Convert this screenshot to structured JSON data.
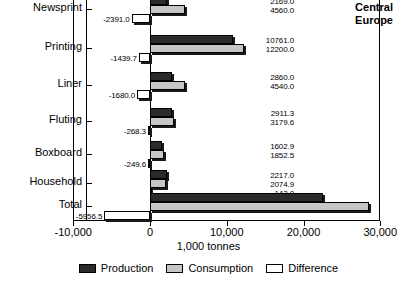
{
  "chart_data": {
    "type": "bar",
    "title": "Central\nEurope",
    "xlabel": "1,000 tonnes",
    "ylabel": "",
    "orientation": "horizontal",
    "grid": false,
    "legend_position": "bottom",
    "xlim": [
      -10000,
      30000
    ],
    "xticks": [
      -10000,
      0,
      10000,
      20000,
      30000
    ],
    "xtick_labels": [
      "-10,000",
      "0",
      "10,000",
      "20,000",
      "30,000"
    ],
    "categories": [
      "Newsprint",
      "Printing",
      "Liner",
      "Fluting",
      "Boxboard",
      "Household",
      "Total"
    ],
    "series": [
      {
        "name": "Production",
        "color": "#2b2b2b",
        "values": [
          2169.0,
          10761.0,
          2860.0,
          2911.3,
          1602.9,
          2217.0,
          22521.0
        ]
      },
      {
        "name": "Consumption",
        "color": "#c6c6c6",
        "values": [
          4560.0,
          12200.0,
          4540.0,
          3179.6,
          1852.5,
          2074.9,
          28477.0
        ]
      },
      {
        "name": "Difference",
        "color": "#ffffff",
        "values": [
          -2391.0,
          -1439.7,
          -1680.0,
          -268.3,
          -249.6,
          143.0,
          -5956.5
        ]
      }
    ],
    "production_labels": [
      "2169.0",
      "10761.0",
      "2860.0",
      "2911.3",
      "1602.9",
      "2217.0",
      "22521.0"
    ],
    "consumption_labels": [
      "4560.0",
      "12200.0",
      "4540.0",
      "3179.6",
      "1852.5",
      "2074.9",
      "28477.0"
    ],
    "difference_labels": [
      "-2391.0",
      "-1439.7",
      "-1680.0",
      "-268.3",
      "-249.6",
      "143.0",
      "-5956.5"
    ]
  },
  "legend": {
    "items": [
      {
        "label": "Production"
      },
      {
        "label": "Consumption"
      },
      {
        "label": "Difference"
      }
    ]
  }
}
